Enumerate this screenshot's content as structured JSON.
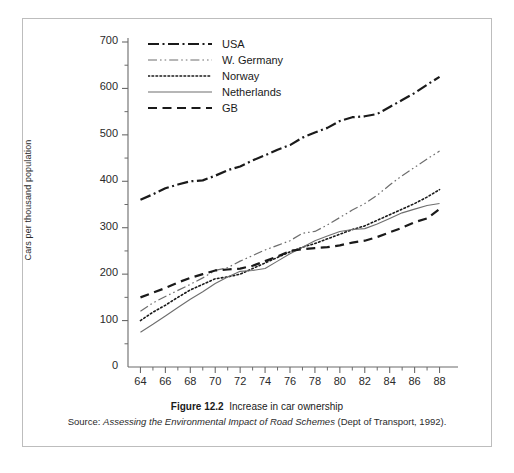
{
  "caption": {
    "figure_number": "Figure 12.2",
    "figure_title": "Increase in car ownership",
    "source_prefix": "Source:",
    "source_title": "Assessing the Environmental Impact of Road Schemes",
    "source_suffix": "(Dept of Transport, 1992)."
  },
  "chart_data": {
    "type": "line",
    "title": "Increase in car ownership",
    "xlabel": "",
    "ylabel": "Cars per thousand population",
    "xlim": [
      63,
      89
    ],
    "ylim": [
      0,
      700
    ],
    "grid": false,
    "legend_position": "top-left-inside",
    "origin_label": "0",
    "x_tick_labels": [
      "64",
      "66",
      "68",
      "70",
      "72",
      "74",
      "76",
      "78",
      "80",
      "82",
      "84",
      "86",
      "88"
    ],
    "x_major_ticks": [
      64,
      66,
      68,
      70,
      72,
      74,
      76,
      78,
      80,
      82,
      84,
      86,
      88
    ],
    "x_minor_ticks": [
      65,
      67,
      69,
      71,
      73,
      75,
      77,
      79,
      81,
      83,
      85,
      87
    ],
    "y_tick_labels": [
      "100",
      "200",
      "300",
      "400",
      "500",
      "600",
      "700"
    ],
    "y_major_ticks": [
      100,
      200,
      300,
      400,
      500,
      600,
      700
    ],
    "y_minor_ticks": [
      50,
      150,
      250,
      350,
      450,
      550,
      650
    ],
    "x": [
      64,
      65,
      66,
      67,
      68,
      69,
      70,
      71,
      72,
      73,
      74,
      75,
      76,
      77,
      78,
      79,
      80,
      81,
      82,
      83,
      84,
      85,
      86,
      87,
      88
    ],
    "series": [
      {
        "name": "USA",
        "style": "dash-dot",
        "color": "#1a1a1a",
        "width": 2.2,
        "values": [
          360,
          372,
          385,
          393,
          400,
          402,
          412,
          424,
          432,
          445,
          456,
          468,
          478,
          494,
          505,
          515,
          530,
          538,
          540,
          545,
          560,
          575,
          590,
          608,
          625
        ]
      },
      {
        "name": "W. Germany",
        "style": "dash-dot-dot",
        "color": "#6e6e6e",
        "width": 1.2,
        "values": [
          120,
          138,
          152,
          165,
          178,
          192,
          208,
          214,
          228,
          240,
          252,
          262,
          272,
          288,
          292,
          306,
          322,
          338,
          352,
          370,
          392,
          412,
          430,
          448,
          465
        ]
      },
      {
        "name": "Norway",
        "style": "dotted",
        "color": "#1a1a1a",
        "width": 1.6,
        "values": [
          100,
          118,
          133,
          150,
          166,
          178,
          190,
          194,
          200,
          212,
          224,
          236,
          248,
          258,
          266,
          276,
          286,
          296,
          304,
          316,
          328,
          340,
          352,
          366,
          382
        ]
      },
      {
        "name": "Netherlands",
        "style": "solid",
        "color": "#6e6e6e",
        "width": 1.1,
        "values": [
          75,
          92,
          110,
          128,
          146,
          162,
          180,
          194,
          206,
          208,
          212,
          228,
          244,
          258,
          272,
          282,
          292,
          296,
          298,
          308,
          320,
          332,
          340,
          348,
          352
        ]
      },
      {
        "name": "GB",
        "style": "dashed",
        "color": "#1a1a1a",
        "width": 2.2,
        "values": [
          150,
          160,
          170,
          182,
          192,
          200,
          208,
          210,
          212,
          218,
          228,
          238,
          250,
          254,
          256,
          258,
          262,
          268,
          272,
          280,
          290,
          300,
          312,
          320,
          340
        ]
      }
    ],
    "legend_entries": [
      {
        "label": "USA",
        "style": "dash-dot"
      },
      {
        "label": "W. Germany",
        "style": "dash-dot-dot"
      },
      {
        "label": "Norway",
        "style": "dotted"
      },
      {
        "label": "Netherlands",
        "style": "solid"
      },
      {
        "label": "GB",
        "style": "dashed"
      }
    ]
  }
}
